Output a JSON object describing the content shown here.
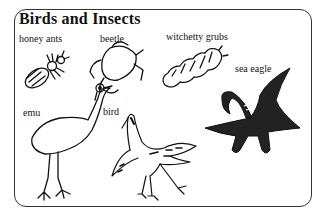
{
  "title": "Birds and Insects",
  "labels": {
    "honey_ants": "honey ants",
    "beetle": "beetle",
    "witchetty_grubs": "witchetty grubs",
    "sea_eagle": "sea eagle",
    "emu": "emu",
    "bird": "bird"
  },
  "colors": {
    "ink": "#111111",
    "frame": "#333333",
    "background": "#ffffff"
  }
}
